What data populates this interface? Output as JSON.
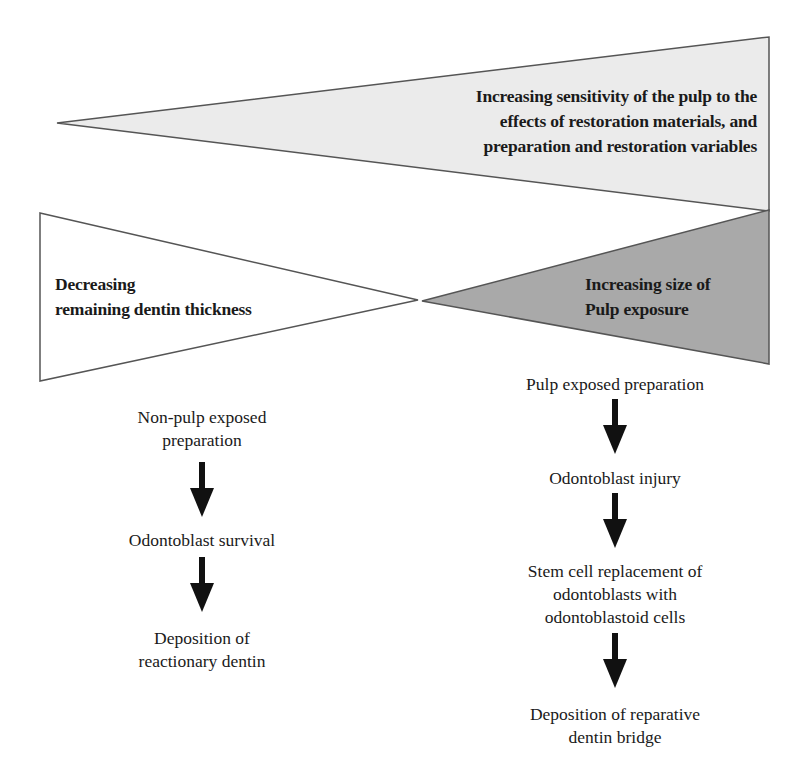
{
  "diagram": {
    "top_wedge": {
      "label_lines": [
        "Increasing sensitivity of the pulp to the",
        "effects of restoration materials, and",
        "preparation and restoration variables"
      ],
      "fill": "#ebebeb"
    },
    "left_wedge": {
      "label_lines": [
        "Decreasing",
        "remaining dentin thickness"
      ],
      "fill": "#ffffff"
    },
    "right_wedge": {
      "label_lines": [
        "Increasing size of",
        "Pulp exposure"
      ],
      "fill": "#a9a9a9"
    },
    "stroke_color": "#555555",
    "arrow_color": "#111111",
    "left_flow": {
      "steps": [
        {
          "lines": [
            "Non-pulp exposed",
            "preparation"
          ]
        },
        {
          "lines": [
            "Odontoblast survival"
          ]
        },
        {
          "lines": [
            "Deposition of",
            "reactionary dentin"
          ]
        }
      ]
    },
    "right_flow": {
      "steps": [
        {
          "lines": [
            "Pulp exposed preparation"
          ]
        },
        {
          "lines": [
            "Odontoblast injury"
          ]
        },
        {
          "lines": [
            "Stem cell replacement of",
            "odontoblasts with",
            "odontoblastoid cells"
          ]
        },
        {
          "lines": [
            "Deposition of reparative",
            "dentin bridge"
          ]
        }
      ]
    }
  }
}
